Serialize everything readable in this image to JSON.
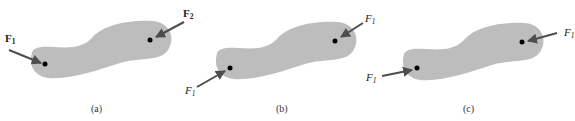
{
  "panels": [
    {
      "id": "a",
      "caption": "(a)",
      "forces": [
        {
          "label": "F",
          "subscript": "1",
          "style": "bold",
          "point": "left-dot"
        },
        {
          "label": "F",
          "subscript": "2",
          "style": "bold",
          "point": "right-dot"
        }
      ]
    },
    {
      "id": "b",
      "caption": "(b)",
      "forces": [
        {
          "label": "F",
          "subscript": "1",
          "style": "italic",
          "point": "left-dot"
        },
        {
          "label": "F",
          "subscript": "1",
          "style": "italic",
          "point": "right-dot"
        }
      ]
    },
    {
      "id": "c",
      "caption": "(c)",
      "forces": [
        {
          "label": "F",
          "subscript": "1",
          "style": "italic",
          "point": "left-dot"
        },
        {
          "label": "F",
          "subscript": "1",
          "style": "italic",
          "point": "right-dot"
        }
      ]
    }
  ],
  "colors": {
    "body": "#bdbdbd",
    "arrow": "#4d4d4d",
    "dot": "#000000"
  }
}
